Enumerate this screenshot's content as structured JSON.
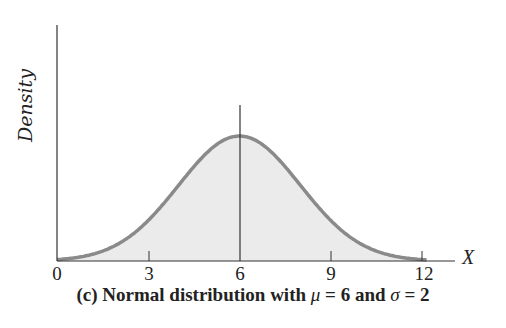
{
  "chart_data": {
    "type": "area",
    "title": "(c) Normal distribution with μ = 6 and σ = 2",
    "xlabel": "X",
    "ylabel": "Density",
    "x_ticks": [
      "0",
      "3",
      "6",
      "9",
      "12"
    ],
    "xlim": [
      0,
      13
    ],
    "mu": 6,
    "sigma": 2,
    "series": [
      {
        "name": "Normal(6, 2) density",
        "x": [
          0,
          1,
          2,
          3,
          4,
          5,
          6,
          7,
          8,
          9,
          10,
          11,
          12
        ],
        "y": [
          0.0022,
          0.0088,
          0.027,
          0.0648,
          0.121,
          0.176,
          0.1995,
          0.176,
          0.121,
          0.0648,
          0.027,
          0.0088,
          0.0022
        ]
      }
    ],
    "annotations": [
      "vertical line at mean x = 6"
    ],
    "grid": false,
    "fill_color": "#ebebeb",
    "curve_color": "#8a8a8a"
  },
  "labels": {
    "ylabel": "Density",
    "xvar": "X",
    "ticks": [
      "0",
      "3",
      "6",
      "9",
      "12"
    ],
    "caption_prefix": "(c)  Normal distribution with ",
    "caption_mu": "μ",
    "caption_mid": " = 6 and ",
    "caption_sigma": "σ",
    "caption_suffix": " = 2"
  }
}
